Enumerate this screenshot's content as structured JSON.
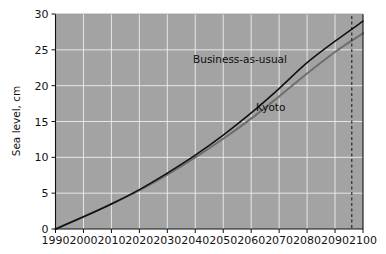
{
  "chart_data": {
    "type": "line",
    "title": "",
    "xlabel": "",
    "ylabel": "Sea level, cm",
    "xlim": [
      1990,
      2100
    ],
    "ylim": [
      0,
      30
    ],
    "xticks": [
      1990,
      2000,
      2010,
      2020,
      2030,
      2040,
      2050,
      2060,
      2070,
      2080,
      2090,
      2100
    ],
    "yticks": [
      0,
      5,
      10,
      15,
      20,
      25,
      30
    ],
    "grid": true,
    "legend_position": "inline-annotations",
    "background_color": "#a3a3a3",
    "gridline_color": "#f2f2f2",
    "x": [
      1990,
      2000,
      2010,
      2020,
      2030,
      2040,
      2050,
      2060,
      2070,
      2080,
      2090,
      2100
    ],
    "series": [
      {
        "name": "Business-as-usual",
        "color": "#111111",
        "values": [
          0.0,
          1.7,
          3.5,
          5.5,
          7.8,
          10.3,
          13.1,
          16.2,
          19.6,
          23.2,
          26.2,
          29.0
        ]
      },
      {
        "name": "Kyoto",
        "color": "#6e6e6e",
        "values": [
          0.0,
          1.7,
          3.5,
          5.4,
          7.6,
          10.0,
          12.6,
          15.4,
          18.5,
          21.7,
          24.7,
          27.3
        ]
      }
    ],
    "annotations": [
      {
        "text": "Business-as-usual",
        "x": 2056,
        "y": 23.2
      },
      {
        "text": "Kyoto",
        "x": 2067,
        "y": 16.4
      },
      {
        "text": "",
        "type": "vertical-dashed-line",
        "x": 2096
      }
    ]
  },
  "axes": {
    "y_title": "Sea level, cm",
    "y_tick_labels": [
      "0",
      "5",
      "10",
      "15",
      "20",
      "25",
      "30"
    ],
    "x_tick_labels": [
      "1990",
      "2000",
      "2010",
      "2020",
      "2030",
      "2040",
      "2050",
      "2060",
      "2070",
      "2080",
      "2090",
      "2100"
    ]
  },
  "labels": {
    "business_as_usual": "Business-as-usual",
    "kyoto": "Kyoto"
  }
}
